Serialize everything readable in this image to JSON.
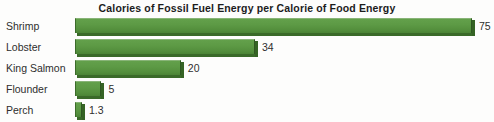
{
  "chart_data": {
    "type": "bar",
    "orientation": "horizontal",
    "title": "Calories of Fossil Fuel Energy per Calorie of Food Energy",
    "xlabel": "",
    "ylabel": "",
    "grid": false,
    "legend": null,
    "xlim": [
      0,
      75
    ],
    "categories": [
      "Shrimp",
      "Lobster",
      "King Salmon",
      "Flounder",
      "Perch"
    ],
    "values": [
      75,
      34,
      20,
      5,
      1.3
    ],
    "value_labels": [
      "75",
      "34",
      "20",
      "5",
      "1.3"
    ],
    "series": [
      {
        "name": "Calories of fossil fuel energy per calorie of food energy",
        "values": [
          75,
          34,
          20,
          5,
          1.3
        ]
      }
    ],
    "bar_color": "#5d9a45",
    "bar_shadow_color": "#356324",
    "background_color": "#fdfdfc",
    "text_color": "#2e2e2e"
  },
  "rows": [
    {
      "label": "Shrimp",
      "value_label": "75"
    },
    {
      "label": "Lobster",
      "value_label": "34"
    },
    {
      "label": "King Salmon",
      "value_label": "20"
    },
    {
      "label": "Flounder",
      "value_label": "5"
    },
    {
      "label": "Perch",
      "value_label": "1.3"
    }
  ]
}
